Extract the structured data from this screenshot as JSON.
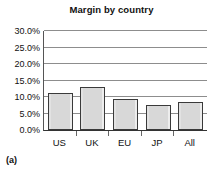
{
  "figure": {
    "panel_label": "(a)"
  },
  "chart_data": {
    "type": "bar",
    "title": "Margin by country",
    "subtitle": "",
    "xlabel": "",
    "ylabel": "",
    "categories": [
      "US",
      "UK",
      "EU",
      "JP",
      "All"
    ],
    "values": [
      11.3,
      13.0,
      9.4,
      7.6,
      8.6
    ],
    "value_labels": [
      "11.3%",
      "13.0%",
      "9.4%",
      "7.6%",
      "8.6%"
    ],
    "ylim": [
      0.0,
      30.0
    ],
    "ytick_values": [
      0.0,
      5.0,
      10.0,
      15.0,
      20.0,
      25.0,
      30.0
    ],
    "ytick_labels": [
      "0.0%",
      "5.0%",
      "10.0%",
      "15.0%",
      "20.0%",
      "25.0%",
      "30.0%"
    ],
    "grid": true,
    "grid_axis": "y",
    "legend": false,
    "legend_position": "none",
    "bar_fill_color": "#d8d8d8",
    "bar_edge_color": "#3a3a3a",
    "gridline_color": "#8d8d8d",
    "axis_color": "#333333",
    "annotations": []
  }
}
